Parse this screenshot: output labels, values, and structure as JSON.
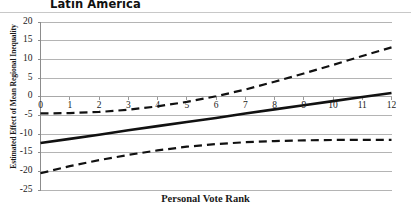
{
  "chart_data": {
    "type": "line",
    "title": "Latin America",
    "xlabel": "Personal Vote Rank",
    "ylabel": "Estimated Effect of Mean Regional Inequality",
    "xlim": [
      0,
      12
    ],
    "ylim": [
      -25,
      20
    ],
    "grid": true,
    "legend": "none",
    "xticks": [
      0,
      1,
      2,
      3,
      4,
      5,
      6,
      7,
      8,
      9,
      10,
      11,
      12
    ],
    "xtick_labels": [
      "0",
      "1",
      "2",
      "3",
      "4",
      "5",
      "6",
      "7",
      "8",
      "9",
      "10",
      "11",
      "12"
    ],
    "yticks": [
      20,
      15,
      10,
      5,
      0,
      -5,
      -10,
      -15,
      -20,
      -25
    ],
    "ytick_labels": [
      "20",
      "15",
      "10",
      "5",
      "0",
      "-5",
      "-10",
      "-15",
      "-20",
      "-25"
    ],
    "x": [
      0,
      1,
      2,
      3,
      4,
      5,
      6,
      7,
      8,
      9,
      10,
      11,
      12
    ],
    "series": [
      {
        "name": "Marginal Effect",
        "style": "solid",
        "color": "#111111",
        "width": 2.6,
        "values": [
          -12.4,
          -11.3,
          -10.2,
          -9.0,
          -7.9,
          -6.8,
          -5.7,
          -4.5,
          -3.4,
          -2.3,
          -1.2,
          -0.1,
          1.0
        ]
      },
      {
        "name": "Upper 95% Confidence Bound",
        "style": "dashed",
        "color": "#111111",
        "width": 2.2,
        "values": [
          -4.5,
          -4.4,
          -4.1,
          -3.5,
          -2.6,
          -1.4,
          0.1,
          1.9,
          4.0,
          6.2,
          8.5,
          10.9,
          13.2
        ]
      },
      {
        "name": "Lower 95% Confidence Bound",
        "style": "dashed",
        "color": "#111111",
        "width": 2.2,
        "values": [
          -20.5,
          -18.6,
          -17.0,
          -15.6,
          -14.4,
          -13.4,
          -12.7,
          -12.2,
          -11.9,
          -11.7,
          -11.6,
          -11.6,
          -11.6
        ]
      }
    ]
  }
}
